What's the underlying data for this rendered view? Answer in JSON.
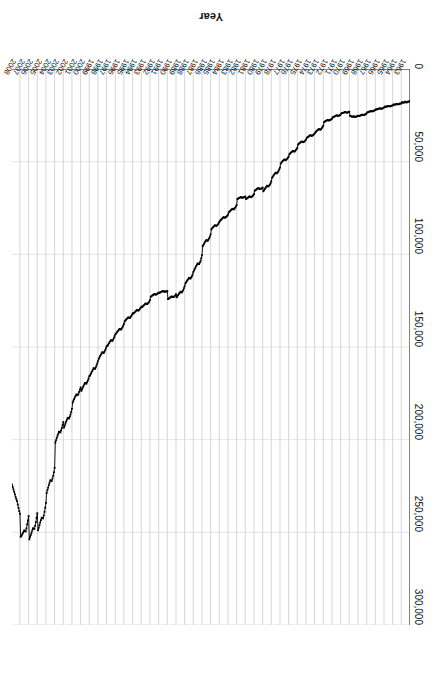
{
  "chart_data": {
    "type": "line",
    "title": "",
    "xlabel": "Year",
    "ylabel": "Median Sales Price",
    "ylim": [
      0,
      300000
    ],
    "ytick_labels": [
      "0",
      "50,000",
      "100,000",
      "150,000",
      "200,000",
      "250,000",
      "300,000"
    ],
    "ytick_values": [
      0,
      50000,
      100000,
      150000,
      200000,
      250000,
      300000
    ],
    "grid": "vertical-year-gridlines",
    "legend": "none",
    "orientation_note": "image is rotated 180 degrees",
    "marker": "small filled square at every monthly point",
    "line_color": "#000000",
    "grid_color": "#c9c9c9",
    "axis_color": "#595959",
    "x_range": [
      1963,
      2008
    ],
    "categories": [
      "1963",
      "1964",
      "1965",
      "1966",
      "1967",
      "1968",
      "1969",
      "1970",
      "1971",
      "1972",
      "1973",
      "1974",
      "1975",
      "1976",
      "1977",
      "1978",
      "1979",
      "1980",
      "1981",
      "1982",
      "1983",
      "1984",
      "1985",
      "1986",
      "1987",
      "1988",
      "1989",
      "1990",
      "1991",
      "1992",
      "1993",
      "1994",
      "1995",
      "1996",
      "1997",
      "1998",
      "1999",
      "2000",
      "2001",
      "2002",
      "2003",
      "2004",
      "2005",
      "2006",
      "2007",
      "2008"
    ],
    "series": [
      {
        "name": "Median Sales Price",
        "frequency": "monthly",
        "annual_values": [
          17800,
          18900,
          20000,
          21400,
          22700,
          24700,
          25600,
          23400,
          25200,
          27600,
          32500,
          35900,
          39300,
          44200,
          48800,
          55700,
          62900,
          64600,
          68900,
          69300,
          75300,
          79900,
          84300,
          92000,
          104500,
          112500,
          120000,
          122900,
          120000,
          121500,
          126500,
          130000,
          133900,
          140000,
          146000,
          152500,
          161000,
          169000,
          175200,
          187600,
          195000,
          221000,
          240900,
          246500,
          247900,
          232100
        ],
        "monthly_values": [
          17200,
          17500,
          17700,
          17600,
          17900,
          18100,
          17800,
          17600,
          18000,
          18200,
          18100,
          17900,
          18500,
          18700,
          18600,
          18900,
          19100,
          19000,
          18800,
          19000,
          19200,
          19100,
          19300,
          19200,
          19600,
          19800,
          20000,
          20100,
          20200,
          20000,
          19900,
          20100,
          20300,
          20200,
          20400,
          20300,
          20800,
          21000,
          21200,
          21400,
          21500,
          21300,
          21200,
          21400,
          21600,
          21700,
          21800,
          21700,
          22100,
          22300,
          22500,
          22700,
          22900,
          22800,
          22600,
          22800,
          23000,
          23100,
          23300,
          23400,
          23900,
          24200,
          24500,
          24700,
          24900,
          24800,
          24600,
          24800,
          25000,
          25100,
          25300,
          25400,
          25200,
          25400,
          25600,
          25800,
          25900,
          25700,
          25500,
          25700,
          25800,
          25600,
          25400,
          25300,
          23000,
          23200,
          23400,
          23600,
          23500,
          23300,
          23200,
          23400,
          23600,
          23700,
          23800,
          23900,
          24600,
          24900,
          25100,
          25300,
          25200,
          25000,
          25100,
          25300,
          25500,
          25700,
          25900,
          26100,
          26800,
          27100,
          27400,
          27600,
          27800,
          27700,
          27500,
          27700,
          27900,
          28100,
          28400,
          28700,
          30600,
          31200,
          31800,
          32400,
          32800,
          32600,
          32400,
          32700,
          33000,
          33400,
          33800,
          34200,
          34800,
          35200,
          35600,
          35900,
          36100,
          35900,
          35700,
          36000,
          36300,
          36600,
          36900,
          37200,
          38100,
          38600,
          39100,
          39300,
          39500,
          39300,
          39100,
          39400,
          39700,
          40000,
          40400,
          40800,
          42500,
          43100,
          43700,
          44200,
          44600,
          44400,
          44200,
          44500,
          44800,
          45200,
          45600,
          46000,
          47300,
          47900,
          48400,
          48800,
          49200,
          49000,
          48800,
          49200,
          49600,
          50000,
          50500,
          51000,
          53200,
          54100,
          54900,
          55700,
          56300,
          56100,
          55900,
          56400,
          56900,
          57500,
          58100,
          58700,
          60600,
          61600,
          62400,
          62900,
          63400,
          63200,
          63000,
          63600,
          64200,
          64800,
          65400,
          66000,
          64000,
          64300,
          64600,
          64600,
          64800,
          64500,
          64200,
          64500,
          64800,
          65100,
          65400,
          65700,
          67500,
          68100,
          68600,
          68900,
          69200,
          69000,
          68700,
          69000,
          69300,
          69600,
          69900,
          70200,
          68800,
          69000,
          69200,
          69300,
          69500,
          69300,
          69100,
          69300,
          69500,
          69700,
          69900,
          70100,
          73400,
          74200,
          74800,
          75300,
          75800,
          75600,
          75400,
          75800,
          76200,
          76600,
          77000,
          77400,
          78600,
          79200,
          79600,
          79900,
          80300,
          80100,
          79900,
          80300,
          80700,
          81100,
          81500,
          81900,
          82600,
          83300,
          83900,
          84300,
          84700,
          84500,
          84300,
          84700,
          85100,
          85500,
          86000,
          86500,
          89200,
          90400,
          91300,
          92000,
          92700,
          92500,
          92300,
          92900,
          93500,
          94200,
          94900,
          95600,
          100500,
          102200,
          103600,
          104500,
          105300,
          105100,
          104900,
          105600,
          106300,
          107100,
          107900,
          108700,
          109500,
          110900,
          111900,
          112500,
          113100,
          112900,
          112700,
          113300,
          113900,
          114500,
          115100,
          115700,
          117200,
          118300,
          119300,
          120000,
          120600,
          120400,
          120200,
          120800,
          121400,
          122000,
          122600,
          123200,
          121500,
          122200,
          122700,
          122900,
          123100,
          122900,
          122700,
          123000,
          123300,
          123600,
          123900,
          124200,
          119800,
          120000,
          120100,
          120000,
          120200,
          120000,
          119800,
          120000,
          120200,
          120400,
          120600,
          120800,
          120600,
          121000,
          121300,
          121500,
          121800,
          121600,
          121400,
          121700,
          122000,
          122300,
          122600,
          122900,
          124700,
          125500,
          126100,
          126500,
          126900,
          126700,
          126500,
          126900,
          127300,
          127700,
          128100,
          128500,
          128200,
          128900,
          129500,
          130000,
          130400,
          130200,
          130000,
          130400,
          130800,
          131200,
          131600,
          132000,
          131800,
          132600,
          133300,
          133900,
          134400,
          134200,
          134000,
          134400,
          134800,
          135200,
          135700,
          136200,
          137500,
          138400,
          139300,
          140000,
          140600,
          140400,
          140200,
          140700,
          141200,
          141700,
          142200,
          142800,
          143200,
          144200,
          145200,
          146000,
          146700,
          146500,
          146300,
          146900,
          147500,
          148100,
          148800,
          149500,
          149600,
          150700,
          151700,
          152500,
          153200,
          153000,
          152800,
          153500,
          154200,
          154900,
          155700,
          156500,
          157700,
          158900,
          160000,
          161000,
          161800,
          161600,
          161400,
          162200,
          163000,
          163800,
          164600,
          165400,
          165700,
          167000,
          168100,
          169000,
          169800,
          169600,
          169400,
          170200,
          171000,
          171900,
          172800,
          173700,
          171800,
          173000,
          174200,
          175200,
          176000,
          175800,
          175600,
          176400,
          177200,
          178100,
          179000,
          179900,
          183400,
          185000,
          186400,
          187600,
          188600,
          188400,
          188200,
          189200,
          190200,
          191300,
          192400,
          193500,
          190500,
          192200,
          193700,
          195000,
          196100,
          195900,
          195700,
          196800,
          197900,
          199100,
          200300,
          201500,
          215200,
          217600,
          219500,
          221000,
          222300,
          222100,
          221900,
          223200,
          224500,
          225900,
          227300,
          228700,
          234100,
          236700,
          238900,
          240900,
          242500,
          242300,
          242100,
          243400,
          244700,
          246100,
          247500,
          248900,
          239700,
          242200,
          244500,
          246500,
          248200,
          248000,
          247800,
          249000,
          250200,
          251400,
          252600,
          253800,
          241200,
          243600,
          245700,
          247900,
          249500,
          249200,
          248900,
          249700,
          250500,
          251200,
          251900,
          252400,
          240000,
          238500,
          236800,
          235000,
          233200,
          232100,
          230900,
          229500,
          228100,
          226800,
          225500,
          224200
        ]
      }
    ]
  },
  "axes": {
    "x_axis_title": "Year",
    "y_axis_title": "Median Sales Price"
  }
}
